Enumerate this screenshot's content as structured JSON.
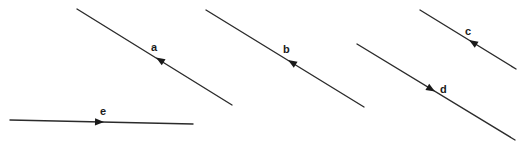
{
  "diagram": {
    "title": "",
    "stroke_color": "#2b2b2b",
    "background": "#ffffff",
    "vectors": [
      {
        "label": "a",
        "start": [
          77,
          9
        ],
        "end": [
          232,
          105
        ],
        "arrow_at": [
          157,
          58
        ],
        "arrow_direction": "up-left",
        "label_pos": [
          151,
          51
        ]
      },
      {
        "label": "b",
        "start": [
          206,
          10
        ],
        "end": [
          364,
          107
        ],
        "arrow_at": [
          289,
          60
        ],
        "arrow_direction": "up-left",
        "label_pos": [
          283,
          53
        ]
      },
      {
        "label": "c",
        "start": [
          420,
          10
        ],
        "end": [
          516,
          69
        ],
        "arrow_at": [
          470,
          41
        ],
        "arrow_direction": "up-left",
        "label_pos": [
          465,
          35
        ]
      },
      {
        "label": "d",
        "start": [
          357,
          44
        ],
        "end": [
          515,
          140
        ],
        "arrow_at": [
          434,
          91
        ],
        "arrow_direction": "down-right",
        "label_pos": [
          440,
          92
        ]
      },
      {
        "label": "e",
        "start": [
          10,
          120
        ],
        "end": [
          193,
          124
        ],
        "arrow_at": [
          102,
          122
        ],
        "arrow_direction": "right",
        "label_pos": [
          100,
          114
        ]
      }
    ]
  }
}
